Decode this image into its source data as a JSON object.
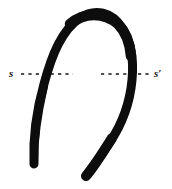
{
  "figure": {
    "caption": "",
    "background_color": "#ffffff",
    "ink_color": "#0d0d0d",
    "section_line": {
      "label_left": "s",
      "label_right": "s′",
      "style": "dashed",
      "y": 74,
      "color": "#151515",
      "left_segment": {
        "x_start": 21,
        "x_end": 73
      },
      "right_segment": {
        "x_start": 101,
        "x_end": 151
      }
    },
    "curve": {
      "name": "hand-drawn-loop-stroke",
      "description": "thick hand-drawn inverted-U / hairpin loop",
      "stroke_color": "#0d0d0d",
      "stroke_width_px": 9,
      "apex": {
        "x": 92,
        "y": 13
      },
      "left_tail_end": {
        "x": 33,
        "y": 166
      },
      "right_tail_end": {
        "x": 85,
        "y": 179
      },
      "path": "M 34 164 C 33 140, 36 112, 44 84 C 52 54, 62 30, 80 18 C 95 8, 112 12, 122 28 C 131 42, 134 60, 132 80 C 130 102, 122 124, 110 142 C 100 157, 92 168, 86 176"
    }
  }
}
